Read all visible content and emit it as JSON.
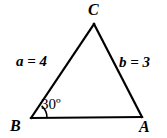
{
  "figure": {
    "type": "triangle-diagram",
    "background_color": "#ffffff",
    "stroke_color": "#000000",
    "stroke_width": 2,
    "width": 167,
    "height": 138
  },
  "vertices": [
    {
      "key": "C",
      "label": "C",
      "x": 94,
      "y": 24,
      "label_x": 88,
      "label_y": 2
    },
    {
      "key": "B",
      "label": "B",
      "x": 31,
      "y": 118,
      "label_x": 10,
      "label_y": 118
    },
    {
      "key": "A",
      "label": "A",
      "x": 142,
      "y": 117,
      "label_x": 139,
      "label_y": 119
    }
  ],
  "sides": [
    {
      "key": "a",
      "label": "a = 4",
      "variable": "a",
      "value": 4,
      "from": "B",
      "to": "C",
      "label_x": 16,
      "label_y": 54
    },
    {
      "key": "b",
      "label": "b = 3",
      "variable": "b",
      "value": 3,
      "from": "C",
      "to": "A",
      "label_x": 119,
      "label_y": 55
    },
    {
      "key": "c",
      "label": "",
      "variable": "c",
      "value": null,
      "from": "B",
      "to": "A",
      "label_x": null,
      "label_y": null
    }
  ],
  "angles": [
    {
      "key": "B",
      "label": "30º",
      "value": 30,
      "unit": "degrees",
      "at_vertex": "B",
      "label_x": 41,
      "label_y": 97,
      "arc_radius": 16
    }
  ]
}
